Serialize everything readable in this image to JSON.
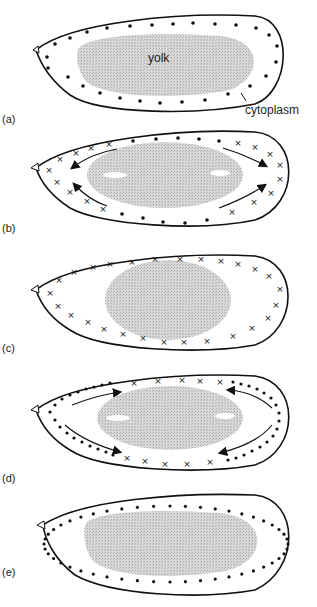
{
  "figure": {
    "panels": [
      {
        "id": "a",
        "label": "(a)",
        "marker": "dot",
        "arrows": false,
        "text_yolk": "yolk",
        "text_cytoplasm": "cytoplasm"
      },
      {
        "id": "b",
        "label": "(b)",
        "marker": "mixed",
        "arrows": true
      },
      {
        "id": "c",
        "label": "(c)",
        "marker": "x",
        "arrows": false
      },
      {
        "id": "d",
        "label": "(d)",
        "marker": "mixed",
        "arrows": true
      },
      {
        "id": "e",
        "label": "(e)",
        "marker": "dot",
        "arrows": false
      }
    ],
    "colors": {
      "outline": "#111111",
      "yolk": "#c8c8c8",
      "marker": "#111111",
      "background": "#ffffff"
    }
  }
}
